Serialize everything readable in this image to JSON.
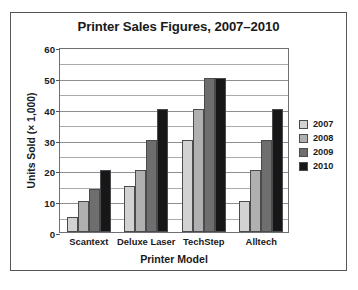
{
  "chart_data": {
    "type": "bar",
    "title": "Printer Sales Figures, 2007–2010",
    "xlabel": "Printer Model",
    "ylabel": "Units Sold (× 1,000)",
    "categories": [
      "Scantext",
      "Deluxe Laser",
      "TechStep",
      "Alltech"
    ],
    "series": [
      {
        "name": "2007",
        "color": "#d2d2d2",
        "values": [
          5,
          15,
          30,
          10
        ]
      },
      {
        "name": "2008",
        "color": "#b0b0b0",
        "values": [
          10,
          20,
          40,
          20
        ]
      },
      {
        "name": "2009",
        "color": "#6e6e6e",
        "values": [
          14,
          30,
          50,
          30
        ]
      },
      {
        "name": "2010",
        "color": "#171717",
        "values": [
          20,
          40,
          50,
          40
        ]
      }
    ],
    "ylim": [
      0,
      60
    ],
    "y_major_ticks": [
      0,
      10,
      20,
      30,
      40,
      50,
      60
    ],
    "y_minor_ticks": [
      5,
      15,
      25,
      35,
      45,
      55
    ],
    "y_tick_labels": [
      "0",
      "10",
      "20",
      "30",
      "40",
      "50",
      "60"
    ],
    "grid": true,
    "legend_position": "right"
  }
}
